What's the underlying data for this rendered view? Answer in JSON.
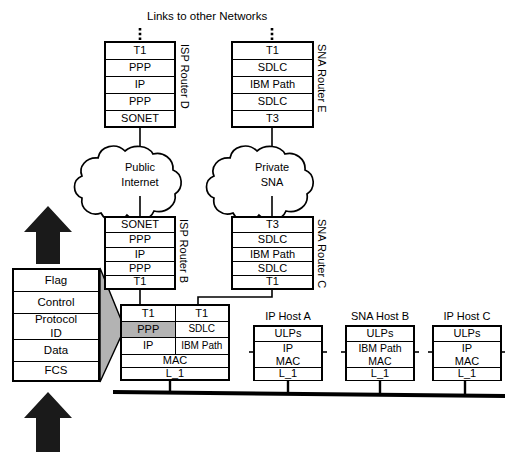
{
  "diagram": {
    "title": "Links to other Networks",
    "clouds": [
      {
        "name": "public-internet",
        "line1": "Public",
        "line2": "Internet"
      },
      {
        "name": "private-sna",
        "line1": "Private",
        "line2": "SNA"
      }
    ],
    "routers": [
      {
        "id": "router-d",
        "label": "ISP Router D",
        "layers": [
          "T1",
          "PPP",
          "IP",
          "PPP",
          "SONET"
        ]
      },
      {
        "id": "router-e",
        "label": "SNA Router E",
        "layers": [
          "T1",
          "SDLC",
          "IBM  Path",
          "SDLC",
          "T3"
        ]
      },
      {
        "id": "router-b",
        "label": "ISP Router B",
        "layers": [
          "SONET",
          "PPP",
          "IP",
          "PPP",
          "T1"
        ]
      },
      {
        "id": "router-c",
        "label": "SNA Router C",
        "layers": [
          "T3",
          "SDLC",
          "IBM  Path",
          "SDLC",
          "T1"
        ]
      }
    ],
    "combined_router": {
      "id": "router-a-combined",
      "left_column": [
        "T1",
        "PPP",
        "IP"
      ],
      "right_column": [
        "T1",
        "SDLC",
        "IBM Path"
      ],
      "shared_rows": [
        "MAC",
        "L_1"
      ],
      "highlighted_cell": "PPP"
    },
    "frame": {
      "id": "ppp-frame",
      "fields": [
        "Flag",
        "Control",
        "Protocol ID",
        "Data",
        "FCS"
      ],
      "protocol_id_line1": "Protocol",
      "protocol_id_line2": "ID"
    },
    "hosts": [
      {
        "id": "ip-host-a",
        "caption": "IP Host A",
        "rows": [
          "ULPs",
          "IP",
          "MAC",
          "L_1"
        ],
        "upper": "IP",
        "lower": "MAC"
      },
      {
        "id": "sna-host-b",
        "caption": "SNA Host B",
        "rows": [
          "ULPs",
          "IBM Path",
          "MAC",
          "L_1"
        ],
        "upper": "IBM Path",
        "lower": "MAC"
      },
      {
        "id": "ip-host-c",
        "caption": "IP Host C",
        "rows": [
          "ULPs",
          "IP",
          "MAC",
          "L_1"
        ],
        "upper": "IP",
        "lower": "MAC"
      }
    ],
    "colors": {
      "stroke": "#000000",
      "shade": "#b3b3b3",
      "arrow": "#1a1a1a",
      "background": "#ffffff"
    }
  }
}
